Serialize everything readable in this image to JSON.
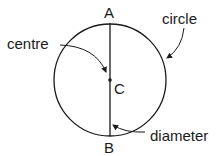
{
  "diagram": {
    "labels": {
      "top_point": "A",
      "bottom_point": "B",
      "centre_point": "C",
      "circle": "circle",
      "centre": "centre",
      "diameter": "diameter"
    },
    "colors": {
      "stroke": "#1a1a1a",
      "background": "#ffffff"
    }
  }
}
